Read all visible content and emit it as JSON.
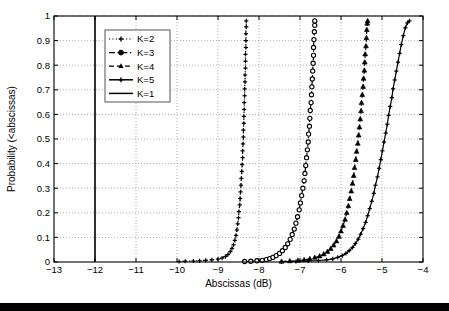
{
  "figure": {
    "background": "#ffffff",
    "axes_color": "#000000",
    "grid_color": "#9a9a9a",
    "bottom_bar_color": "#000000"
  },
  "chart_data": {
    "type": "line",
    "title": "",
    "subtitle": "",
    "xlabel": "Abscissas (dB)",
    "ylabel": "Probability (<abscissas)",
    "xlim": [
      -13,
      -4
    ],
    "ylim": [
      0,
      1
    ],
    "xticks": [
      -13,
      -12,
      -11,
      -10,
      -9,
      -8,
      -7,
      -6,
      -5,
      -4
    ],
    "xticklabels": [
      "-13",
      "-12",
      "-11",
      "-10",
      "-9",
      "-8",
      "-7",
      "-6",
      "-5",
      "-4"
    ],
    "yticks": [
      0,
      0.1,
      0.2,
      0.3,
      0.4,
      0.5,
      0.6,
      0.7,
      0.8,
      0.9,
      1
    ],
    "yticklabels": [
      "0",
      "0.1",
      "0.2",
      "0.3",
      "0.4",
      "0.5",
      "0.6",
      "0.7",
      "0.8",
      "0.9",
      "1"
    ],
    "grid": true,
    "grid_style": "dotted",
    "legend_position": "upper left",
    "legend_entries": [
      "K=2",
      "K=3",
      "K=4",
      "K=5",
      "K=1"
    ],
    "series": [
      {
        "name": "K=2",
        "linestyle": "dotted",
        "marker": "plus",
        "color": "#000000",
        "points": [
          [
            -9.95,
            0.002
          ],
          [
            -9.8,
            0.003
          ],
          [
            -9.6,
            0.004
          ],
          [
            -9.45,
            0.005
          ],
          [
            -9.3,
            0.007
          ],
          [
            -9.15,
            0.009
          ],
          [
            -9.0,
            0.012
          ],
          [
            -8.9,
            0.016
          ],
          [
            -8.82,
            0.022
          ],
          [
            -8.76,
            0.03
          ],
          [
            -8.7,
            0.042
          ],
          [
            -8.66,
            0.055
          ],
          [
            -8.62,
            0.07
          ],
          [
            -8.59,
            0.088
          ],
          [
            -8.56,
            0.108
          ],
          [
            -8.54,
            0.13
          ],
          [
            -8.52,
            0.155
          ],
          [
            -8.5,
            0.18
          ],
          [
            -8.49,
            0.205
          ],
          [
            -8.47,
            0.232
          ],
          [
            -8.46,
            0.258
          ],
          [
            -8.45,
            0.285
          ],
          [
            -8.44,
            0.312
          ],
          [
            -8.43,
            0.34
          ],
          [
            -8.42,
            0.368
          ],
          [
            -8.41,
            0.396
          ],
          [
            -8.4,
            0.424
          ],
          [
            -8.4,
            0.452
          ],
          [
            -8.39,
            0.48
          ],
          [
            -8.38,
            0.508
          ],
          [
            -8.38,
            0.536
          ],
          [
            -8.37,
            0.564
          ],
          [
            -8.37,
            0.592
          ],
          [
            -8.36,
            0.62
          ],
          [
            -8.36,
            0.648
          ],
          [
            -8.35,
            0.676
          ],
          [
            -8.35,
            0.704
          ],
          [
            -8.34,
            0.732
          ],
          [
            -8.34,
            0.76
          ],
          [
            -8.33,
            0.788
          ],
          [
            -8.33,
            0.816
          ],
          [
            -8.33,
            0.844
          ],
          [
            -8.32,
            0.872
          ],
          [
            -8.32,
            0.9
          ],
          [
            -8.32,
            0.928
          ],
          [
            -8.31,
            0.956
          ],
          [
            -8.31,
            0.98
          ]
        ]
      },
      {
        "name": "K=3",
        "linestyle": "dashdot",
        "marker": "circle",
        "color": "#000000",
        "points": [
          [
            -8.35,
            0.002
          ],
          [
            -8.2,
            0.003
          ],
          [
            -8.05,
            0.005
          ],
          [
            -7.92,
            0.007
          ],
          [
            -7.82,
            0.01
          ],
          [
            -7.74,
            0.014
          ],
          [
            -7.66,
            0.019
          ],
          [
            -7.58,
            0.026
          ],
          [
            -7.5,
            0.035
          ],
          [
            -7.43,
            0.046
          ],
          [
            -7.36,
            0.059
          ],
          [
            -7.3,
            0.074
          ],
          [
            -7.24,
            0.092
          ],
          [
            -7.19,
            0.112
          ],
          [
            -7.14,
            0.134
          ],
          [
            -7.1,
            0.158
          ],
          [
            -7.06,
            0.184
          ],
          [
            -7.02,
            0.212
          ],
          [
            -6.99,
            0.24
          ],
          [
            -6.96,
            0.27
          ],
          [
            -6.93,
            0.3
          ],
          [
            -6.9,
            0.33
          ],
          [
            -6.88,
            0.36
          ],
          [
            -6.86,
            0.392
          ],
          [
            -6.84,
            0.424
          ],
          [
            -6.82,
            0.456
          ],
          [
            -6.8,
            0.488
          ],
          [
            -6.79,
            0.52
          ],
          [
            -6.77,
            0.552
          ],
          [
            -6.76,
            0.584
          ],
          [
            -6.75,
            0.616
          ],
          [
            -6.73,
            0.648
          ],
          [
            -6.72,
            0.68
          ],
          [
            -6.71,
            0.712
          ],
          [
            -6.7,
            0.744
          ],
          [
            -6.69,
            0.776
          ],
          [
            -6.68,
            0.808
          ],
          [
            -6.67,
            0.84
          ],
          [
            -6.67,
            0.872
          ],
          [
            -6.66,
            0.904
          ],
          [
            -6.65,
            0.936
          ],
          [
            -6.64,
            0.962
          ],
          [
            -6.64,
            0.98
          ]
        ]
      },
      {
        "name": "K=4",
        "linestyle": "dashed",
        "marker": "triangle",
        "color": "#000000",
        "points": [
          [
            -7.45,
            0.002
          ],
          [
            -7.25,
            0.004
          ],
          [
            -7.05,
            0.006
          ],
          [
            -6.9,
            0.009
          ],
          [
            -6.76,
            0.013
          ],
          [
            -6.64,
            0.018
          ],
          [
            -6.52,
            0.024
          ],
          [
            -6.42,
            0.032
          ],
          [
            -6.33,
            0.042
          ],
          [
            -6.25,
            0.054
          ],
          [
            -6.18,
            0.068
          ],
          [
            -6.11,
            0.085
          ],
          [
            -6.05,
            0.104
          ],
          [
            -6.0,
            0.125
          ],
          [
            -5.95,
            0.148
          ],
          [
            -5.9,
            0.173
          ],
          [
            -5.86,
            0.2
          ],
          [
            -5.82,
            0.228
          ],
          [
            -5.79,
            0.257
          ],
          [
            -5.75,
            0.288
          ],
          [
            -5.72,
            0.319
          ],
          [
            -5.69,
            0.351
          ],
          [
            -5.67,
            0.383
          ],
          [
            -5.64,
            0.416
          ],
          [
            -5.62,
            0.449
          ],
          [
            -5.59,
            0.482
          ],
          [
            -5.57,
            0.515
          ],
          [
            -5.55,
            0.548
          ],
          [
            -5.53,
            0.581
          ],
          [
            -5.51,
            0.614
          ],
          [
            -5.5,
            0.647
          ],
          [
            -5.48,
            0.68
          ],
          [
            -5.46,
            0.713
          ],
          [
            -5.45,
            0.746
          ],
          [
            -5.43,
            0.779
          ],
          [
            -5.42,
            0.812
          ],
          [
            -5.41,
            0.845
          ],
          [
            -5.39,
            0.878
          ],
          [
            -5.38,
            0.911
          ],
          [
            -5.37,
            0.944
          ],
          [
            -5.36,
            0.97
          ],
          [
            -5.35,
            0.98
          ]
        ]
      },
      {
        "name": "K=5",
        "linestyle": "solid",
        "marker": "plus",
        "color": "#000000",
        "points": [
          [
            -7.45,
            0.001
          ],
          [
            -7.1,
            0.002
          ],
          [
            -6.8,
            0.004
          ],
          [
            -6.55,
            0.006
          ],
          [
            -6.35,
            0.009
          ],
          [
            -6.2,
            0.013
          ],
          [
            -6.08,
            0.019
          ],
          [
            -5.97,
            0.026
          ],
          [
            -5.88,
            0.035
          ],
          [
            -5.8,
            0.046
          ],
          [
            -5.72,
            0.059
          ],
          [
            -5.65,
            0.075
          ],
          [
            -5.58,
            0.093
          ],
          [
            -5.52,
            0.113
          ],
          [
            -5.46,
            0.136
          ],
          [
            -5.4,
            0.161
          ],
          [
            -5.35,
            0.188
          ],
          [
            -5.3,
            0.217
          ],
          [
            -5.25,
            0.247
          ],
          [
            -5.2,
            0.279
          ],
          [
            -5.16,
            0.312
          ],
          [
            -5.11,
            0.346
          ],
          [
            -5.07,
            0.381
          ],
          [
            -5.03,
            0.416
          ],
          [
            -4.99,
            0.452
          ],
          [
            -4.95,
            0.488
          ],
          [
            -4.91,
            0.524
          ],
          [
            -4.87,
            0.56
          ],
          [
            -4.84,
            0.596
          ],
          [
            -4.8,
            0.632
          ],
          [
            -4.76,
            0.668
          ],
          [
            -4.73,
            0.704
          ],
          [
            -4.69,
            0.74
          ],
          [
            -4.65,
            0.776
          ],
          [
            -4.61,
            0.812
          ],
          [
            -4.57,
            0.848
          ],
          [
            -4.53,
            0.884
          ],
          [
            -4.48,
            0.92
          ],
          [
            -4.43,
            0.952
          ],
          [
            -4.38,
            0.972
          ],
          [
            -4.33,
            0.98
          ]
        ]
      },
      {
        "name": "K=1",
        "linestyle": "solid",
        "marker": "none",
        "color": "#000000",
        "vertical_line_x": -12,
        "points": [
          [
            -12,
            0
          ],
          [
            -12,
            1
          ]
        ]
      }
    ]
  }
}
